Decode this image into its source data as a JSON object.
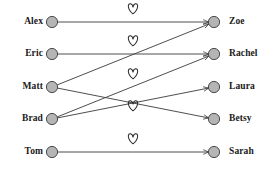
{
  "diagram": {
    "type": "bipartite-matching-graph",
    "width": 277,
    "height": 172,
    "background_color": "#ffffff",
    "node_fill_color": "#b5b5b5",
    "node_stroke_color": "#3a3a3a",
    "edge_color": "#3a3a3a",
    "heart_stroke_color": "#2e2e2e",
    "label_color": "#1a1a1a"
  },
  "left_column": {
    "name": "men",
    "node_x": 52,
    "label_right_edge_x": 43,
    "nodes": [
      {
        "id": "alex",
        "label": "Alex",
        "x": 52,
        "y": 22
      },
      {
        "id": "eric",
        "label": "Eric",
        "x": 52,
        "y": 54
      },
      {
        "id": "matt",
        "label": "Matt",
        "x": 52,
        "y": 87
      },
      {
        "id": "brad",
        "label": "Brad",
        "x": 52,
        "y": 119
      },
      {
        "id": "tom",
        "label": "Tom",
        "x": 52,
        "y": 152
      }
    ]
  },
  "right_column": {
    "name": "women",
    "node_x": 214,
    "label_left_edge_x": 229,
    "nodes": [
      {
        "id": "zoe",
        "label": "Zoe",
        "x": 214,
        "y": 22
      },
      {
        "id": "rachel",
        "label": "Rachel",
        "x": 214,
        "y": 54
      },
      {
        "id": "laura",
        "label": "Laura",
        "x": 214,
        "y": 87
      },
      {
        "id": "betsy",
        "label": "Betsy",
        "x": 214,
        "y": 119
      },
      {
        "id": "sarah",
        "label": "Sarah",
        "x": 214,
        "y": 152
      }
    ]
  },
  "edges": [
    {
      "from": "alex",
      "to": "zoe",
      "x1": 52,
      "y1": 22,
      "x2": 214,
      "y2": 22
    },
    {
      "from": "eric",
      "to": "rachel",
      "x1": 52,
      "y1": 54,
      "x2": 214,
      "y2": 54
    },
    {
      "from": "matt",
      "to": "zoe",
      "x1": 52,
      "y1": 87,
      "x2": 214,
      "y2": 22
    },
    {
      "from": "matt",
      "to": "betsy",
      "x1": 52,
      "y1": 87,
      "x2": 214,
      "y2": 119
    },
    {
      "from": "brad",
      "to": "rachel",
      "x1": 52,
      "y1": 119,
      "x2": 214,
      "y2": 54
    },
    {
      "from": "brad",
      "to": "laura",
      "x1": 52,
      "y1": 119,
      "x2": 214,
      "y2": 87
    },
    {
      "from": "tom",
      "to": "sarah",
      "x1": 52,
      "y1": 152,
      "x2": 214,
      "y2": 152
    }
  ],
  "hearts": [
    {
      "id": "heart-row-1",
      "x": 133,
      "y": 9
    },
    {
      "id": "heart-row-2",
      "x": 133,
      "y": 41
    },
    {
      "id": "heart-row-3",
      "x": 133,
      "y": 74
    },
    {
      "id": "heart-row-4",
      "x": 133,
      "y": 106
    },
    {
      "id": "heart-row-5",
      "x": 133,
      "y": 139
    }
  ]
}
